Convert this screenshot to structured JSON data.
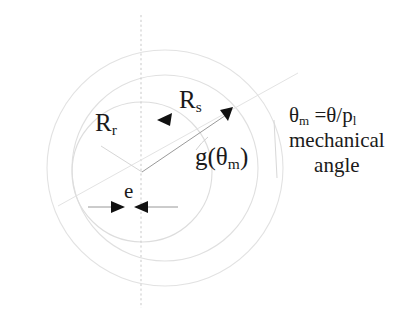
{
  "figure": {
    "background_color": "#ffffff",
    "ink_color": "#1a1a1a",
    "construction_line_color": "#d9d9d9",
    "dashed_axis_color": "#cfcfcf"
  },
  "labels": {
    "rotor_radius": {
      "symbol": "R",
      "subscript": "r",
      "text": "Rr"
    },
    "stator_radius": {
      "symbol": "R",
      "subscript": "s",
      "text": "Rs"
    },
    "eccentricity": {
      "text": "e"
    },
    "airgap_function": {
      "symbol": "g(",
      "theta": "θ",
      "subscript": "m",
      "close": ")",
      "text": "g(θm)"
    }
  },
  "annotation": {
    "line_1_prefix": "θ",
    "line_1_sub": "m",
    "line_1_rest": " =θ/p",
    "line_1_sub2": "l",
    "line_1_text": "θm =θ/pl",
    "line_2_text": "mechanical",
    "line_3_text": "angle"
  },
  "geometry": {
    "canvas": {
      "width": 418,
      "height": 317
    },
    "stator_center": {
      "x": 165,
      "y": 168
    },
    "rotor_center": {
      "x": 142,
      "y": 172
    },
    "stator_outer_radius": 118,
    "stator_bore_radius": 93,
    "rotor_radius": 70,
    "vertical_axis_x": 141,
    "vertical_axis_top": 15,
    "vertical_axis_bottom": 308,
    "eccentricity_line_y": 207,
    "eccentricity_arrow_left_x": 113,
    "eccentricity_arrow_right_x": 147,
    "ray_rotor_end": {
      "x": 100,
      "y": 145
    },
    "ray_stator_end": {
      "x": 232,
      "y": 110
    },
    "long_line_start": {
      "x": 60,
      "y": 205
    },
    "long_line_end": {
      "x": 296,
      "y": 74
    }
  }
}
